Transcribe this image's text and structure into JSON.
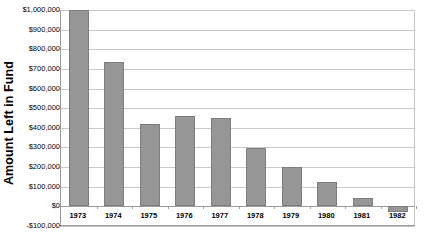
{
  "chart_data": {
    "type": "bar",
    "title": "",
    "xlabel": "",
    "ylabel": "Amount Left in Fund",
    "categories": [
      "1973",
      "1974",
      "1975",
      "1976",
      "1977",
      "1978",
      "1979",
      "1980",
      "1981",
      "1982"
    ],
    "values": [
      1000000,
      735000,
      420000,
      458000,
      450000,
      298000,
      200000,
      122000,
      45000,
      -28000
    ],
    "series": [
      {
        "name": "Amount Left in Fund",
        "values": [
          1000000,
          735000,
          420000,
          458000,
          450000,
          298000,
          200000,
          122000,
          45000,
          -28000
        ]
      }
    ],
    "ylim": [
      -100000,
      1000000
    ],
    "ytick_values": [
      1000000,
      900000,
      800000,
      700000,
      600000,
      500000,
      400000,
      300000,
      200000,
      100000,
      0,
      -100000
    ],
    "ytick_labels": [
      "$1,000,000",
      "$900,000",
      "$800,000",
      "$700,000",
      "$600,000",
      "$500,000",
      "$400,000",
      "$300,000",
      "$200,000",
      "$100,000",
      "$0",
      "-$100,000"
    ],
    "grid": true,
    "legend": false,
    "legend_position": "none",
    "bar_color": "#969696",
    "bar_border_color": "#7d7d7d",
    "gridline_color": "#c9c9c9",
    "axis_color": "#9a9a9a",
    "background_color": "#ffffff",
    "annotations": []
  }
}
